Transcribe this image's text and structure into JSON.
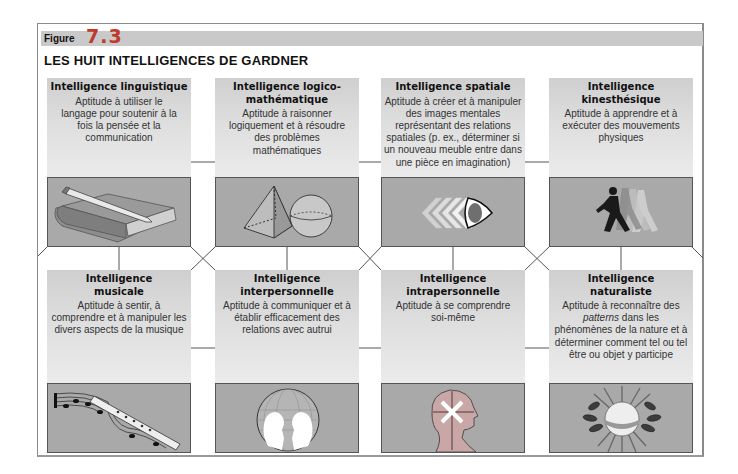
{
  "figure": {
    "label": "Figure",
    "number": "7.3",
    "title": "LES HUIT INTELLIGENCES DE GARDNER"
  },
  "intelligences": [
    {
      "name": "Intelligence linguistique",
      "description": "Aptitude à utiliser le langage pour soutenir à la fois la pensée et la communication",
      "icon": "book-pencil-icon"
    },
    {
      "name": "Intelligence logico-mathématique",
      "description": "Aptitude à raisonner logiquement et à résoudre des problèmes mathématiques",
      "icon": "pyramid-sphere-icon"
    },
    {
      "name": "Intelligence spatiale",
      "description": "Aptitude à créer et à manipuler des images mentales représentant des relations spatiales (p. ex., déterminer si un nouveau meuble entre dans une pièce en imagination)",
      "icon": "eye-chevrons-icon"
    },
    {
      "name": "Intelligence kinesthésique",
      "description": "Aptitude à apprendre et à exécuter des mouvements physiques",
      "icon": "runner-icon"
    },
    {
      "name": "Intelligence musicale",
      "description": "Aptitude à sentir, à comprendre et à manipuler les divers aspects de la musique",
      "icon": "flute-music-notes-icon"
    },
    {
      "name": "Intelligence interpersonnelle",
      "description": "Aptitude à communiquer et à établir efficacement des relations avec autrui",
      "icon": "two-faces-globe-icon"
    },
    {
      "name": "Intelligence intrapersonnelle",
      "description": "Aptitude à se comprendre soi-même",
      "icon": "head-profile-icon"
    },
    {
      "name": "Intelligence naturaliste",
      "description_parts": [
        "Aptitude à reconnaître des ",
        "patterns",
        " dans les phénomènes de la nature et à déterminer comment tel ou tel être ou objet y participe"
      ],
      "icon": "sun-leaves-icon"
    }
  ]
}
